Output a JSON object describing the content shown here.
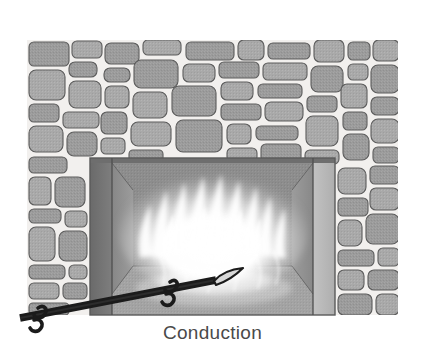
{
  "figure": {
    "caption": "Conduction",
    "caption_color": "#4a4a4a",
    "background_color": "#ffffff",
    "style": "grayscale-illustration"
  },
  "scene": {
    "wall": {
      "name": "stone-wall",
      "mortar_color": "#f2f0ee",
      "stone_fill_color": "#999999",
      "stone_fill_light": "#ababab",
      "stone_outline_color": "#5a5a5a",
      "bounds": {
        "x": 27,
        "y": 40,
        "width": 371,
        "height": 275
      }
    },
    "fireplace": {
      "name": "fireplace-opening",
      "back_wall_color": "#8d8d8d",
      "left_jamb_color": "#6f6f6f",
      "right_jamb_color": "#b9b9b9",
      "hearth_floor_color": "#a2a2a2",
      "lintel_color": "#7a7a7a",
      "bounds": {
        "x": 90,
        "y": 158,
        "width": 245,
        "height": 157
      }
    },
    "fire": {
      "name": "flames",
      "core_color": "#fbfbfb",
      "mid_color": "#e2e2e2",
      "edge_color": "#bdbdbd",
      "center": {
        "x": 213,
        "y": 230
      }
    },
    "poker": {
      "name": "fire-poker",
      "shaft_color": "#1a1a1a",
      "tip_color": "#d8d8d8",
      "tip_outline_color": "#1a1a1a",
      "angle_degrees": -12,
      "handle_end": {
        "x": 22,
        "y": 314
      },
      "tip_end": {
        "x": 230,
        "y": 276
      }
    }
  }
}
